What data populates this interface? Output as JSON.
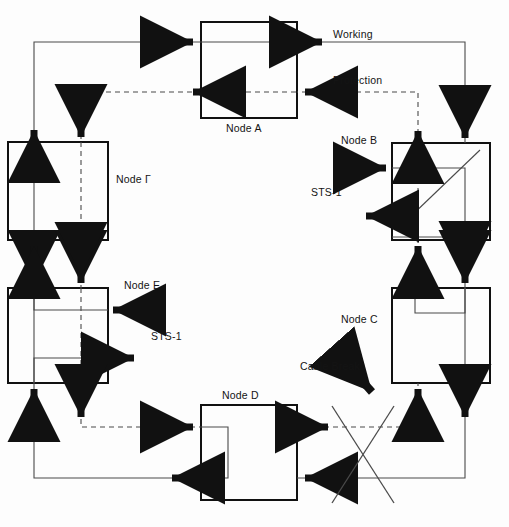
{
  "diagram": {
    "type": "network-ring-diagram",
    "colors": {
      "line": "#111111",
      "thin_line": "#4a4a4a",
      "background": "#fdfdfd",
      "text": "#141414"
    },
    "nodes": [
      {
        "id": "A",
        "label": "Node A",
        "x": 201,
        "y": 22,
        "w": 96,
        "h": 96,
        "label_x": 226,
        "label_y": 122
      },
      {
        "id": "B",
        "label": "Node B",
        "x": 392,
        "y": 143,
        "w": 98,
        "h": 97,
        "label_x": 341,
        "label_y": 134
      },
      {
        "id": "C",
        "label": "Node C",
        "x": 392,
        "y": 288,
        "w": 98,
        "h": 95,
        "label_x": 341,
        "label_y": 313
      },
      {
        "id": "D",
        "label": "Node D",
        "x": 201,
        "y": 405,
        "w": 96,
        "h": 95,
        "label_x": 222,
        "label_y": 389
      },
      {
        "id": "E",
        "label": "Node E",
        "x": 8,
        "y": 288,
        "w": 100,
        "h": 95,
        "label_x": 124,
        "label_y": 279
      },
      {
        "id": "F",
        "label": "Node Г",
        "x": 8,
        "y": 142,
        "w": 100,
        "h": 98,
        "label_x": 116,
        "label_y": 173
      }
    ],
    "annotations": [
      {
        "name": "working-label",
        "text": "Working",
        "x": 333,
        "y": 28
      },
      {
        "name": "protection-label",
        "text": "Protection",
        "x": 333,
        "y": 74
      },
      {
        "name": "sts1-label-b",
        "text": "STS-1",
        "x": 311,
        "y": 186
      },
      {
        "name": "sts1-label-e",
        "text": "STS-1",
        "x": 151,
        "y": 330
      },
      {
        "name": "cable-break-label",
        "text": "Cable Break",
        "x": 300,
        "y": 360
      }
    ],
    "legend": {
      "working": "Working",
      "protection": "Protection",
      "traffic_unit": "STS-1",
      "fault": "Cable Break"
    },
    "ring_order": [
      "Node A",
      "Node B",
      "Node C",
      "Node D",
      "Node E",
      "Node Г"
    ],
    "fault": {
      "label": "Cable Break",
      "between": [
        "Node D",
        "Node C"
      ],
      "marker": "X"
    }
  }
}
